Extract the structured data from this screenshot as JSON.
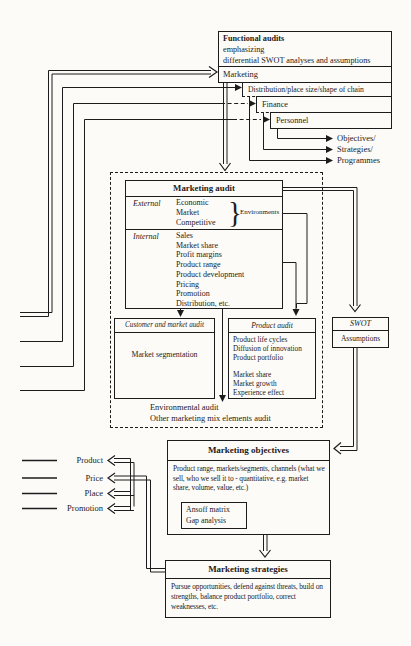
{
  "functional_audits": {
    "title": "Functional audits",
    "sub1": "emphasizing",
    "sub2": "differential SWOT analyses and assumptions",
    "marketing": "Marketing"
  },
  "cascade": {
    "distribution": "Distribution/place size/shape of chain",
    "finance": "Finance",
    "personnel": "Personnel"
  },
  "outputs": [
    "Objectives/",
    "Strategies/",
    "Programmes"
  ],
  "marketing_audit": {
    "title": "Marketing audit",
    "external_label": "External",
    "external_items": [
      "Economic",
      "Market",
      "Competitive"
    ],
    "brace": "}",
    "environments": "Environments",
    "internal_label": "Internal",
    "internal_items": [
      "Sales",
      "Market share",
      "Profit margins",
      "Product range",
      "Product development",
      "Pricing",
      "Promotion",
      "Distribution, etc."
    ]
  },
  "customer_audit": {
    "title": "Customer and market audit",
    "body": "Market segmentation"
  },
  "product_audit": {
    "title": "Product audit",
    "items_top": [
      "Product life cycles",
      "Diffusion of innovation",
      "Product portfolio"
    ],
    "items_bottom": [
      "Market share",
      "Market growth",
      "Experience effect"
    ]
  },
  "swot": {
    "title": "SWOT",
    "body": "Assumptions"
  },
  "environmental": {
    "line1": "Environmental audit",
    "line2": "Other marketing mix elements audit"
  },
  "objectives": {
    "title": "Marketing objectives",
    "body": "Product range, markets/segments, channels (what we sell, who we sell it to - quantitative, e.g. market share, volume, value, etc.)",
    "tool1": "Ansoff matrix",
    "tool2": "Gap analysis"
  },
  "strategies": {
    "title": "Marketing strategies",
    "body": "Pursue opportunities, defend against threats, build on strengths, balance product portfolio, correct weaknesses, etc."
  },
  "four_ps": [
    "Product",
    "Price",
    "Place",
    "Promotion"
  ],
  "colors": {
    "line": "#1c1c1c",
    "paper": "#fcfbf8"
  }
}
